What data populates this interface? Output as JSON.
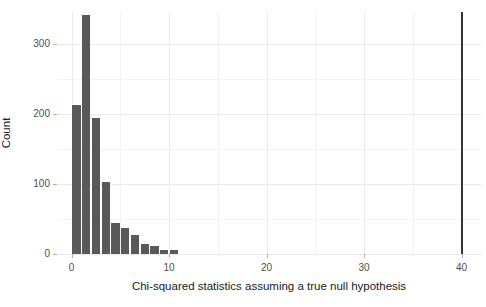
{
  "chart_data": {
    "type": "bar",
    "title": "",
    "subtitle": "",
    "xlabel": "Chi-squared statistics assuming a true null hypothesis",
    "ylabel": "Count",
    "xlim": [
      -1.5,
      42
    ],
    "ylim": [
      0,
      345
    ],
    "grid": true,
    "legend": "none",
    "x_ticks": [
      {
        "value": 0,
        "label": "0"
      },
      {
        "value": 10,
        "label": "10"
      },
      {
        "value": 20,
        "label": "20"
      },
      {
        "value": 30,
        "label": "30"
      },
      {
        "value": 40,
        "label": "40"
      }
    ],
    "y_ticks": [
      {
        "value": 0,
        "label": "0"
      },
      {
        "value": 100,
        "label": "100"
      },
      {
        "value": 200,
        "label": "200"
      },
      {
        "value": 300,
        "label": "300"
      }
    ],
    "x_minor_ticks": [
      5,
      15,
      25,
      35
    ],
    "y_minor_ticks": [
      50,
      150,
      250,
      350
    ],
    "bar_color": "#595959",
    "bar_width": 0.85,
    "bins": [
      {
        "center": 0.5,
        "value": 212
      },
      {
        "center": 1.5,
        "value": 341
      },
      {
        "center": 2.5,
        "value": 194
      },
      {
        "center": 3.5,
        "value": 102
      },
      {
        "center": 4.5,
        "value": 44
      },
      {
        "center": 5.5,
        "value": 37
      },
      {
        "center": 6.5,
        "value": 27
      },
      {
        "center": 7.5,
        "value": 14
      },
      {
        "center": 8.5,
        "value": 12
      },
      {
        "center": 9.5,
        "value": 6
      },
      {
        "center": 10.5,
        "value": 5
      }
    ],
    "annotations": [
      {
        "type": "vline",
        "name": "observed-statistic-line",
        "x": 40,
        "color": "#333333",
        "width_px": 2
      }
    ]
  }
}
